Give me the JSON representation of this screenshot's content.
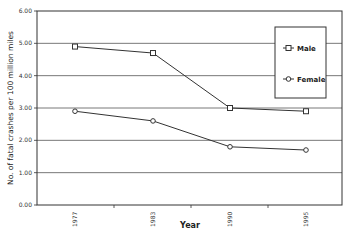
{
  "chart_data": {
    "type": "line",
    "title": "",
    "xlabel": "Year",
    "ylabel": "No. of fatal crashes per 100 million miles",
    "categories": [
      "1977",
      "1983",
      "1990",
      "1995"
    ],
    "series": [
      {
        "name": "Male",
        "marker": "square",
        "values": [
          4.9,
          4.7,
          3.0,
          2.9
        ]
      },
      {
        "name": "Female",
        "marker": "circle",
        "values": [
          2.9,
          2.6,
          1.8,
          1.7
        ]
      }
    ],
    "ylim": [
      0,
      6
    ],
    "yticks": [
      "0.00",
      "1.00",
      "2.00",
      "3.00",
      "4.00",
      "5.00",
      "6.00"
    ],
    "grid": true,
    "legend_position": "upper right inside"
  },
  "legend": {
    "male_label": "Male",
    "female_label": "Female"
  },
  "colors": {
    "line": "#333333",
    "grid": "#555555",
    "background": "#ffffff"
  }
}
